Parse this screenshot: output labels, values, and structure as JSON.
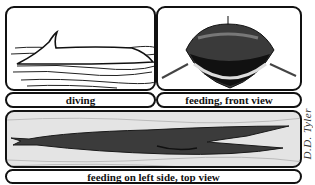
{
  "figure": {
    "panels": [
      {
        "id": "diving",
        "caption": "diving"
      },
      {
        "id": "feeding-front",
        "caption": "feeding, front view"
      },
      {
        "id": "feeding-top",
        "caption": "feeding on left side, top view"
      }
    ],
    "artist_credit": "D.D. Tyler"
  }
}
